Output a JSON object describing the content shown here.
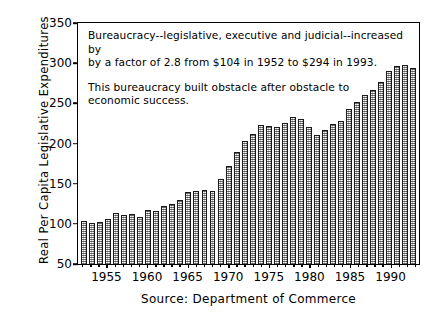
{
  "figure": {
    "ylabel": "Real Per Capita Legislative Expenditures",
    "source_note": "Source: Department of Commerce",
    "annotation_line_1": "Bureaucracy--legislative, executive and judicial--increased by",
    "annotation_line_2": "by a factor of 2.8 from $104 in 1952 to $294 in 1993.",
    "annotation_line_3": "This bureaucracy built obstacle after obstacle to",
    "annotation_line_4": "economic success.",
    "colors": {
      "bar_fill": "#c9c9c9",
      "bar_edge": "#1a1a1a",
      "axis": "#000000",
      "background": "#ffffff"
    }
  },
  "chart_data": {
    "type": "bar",
    "title": "",
    "xlabel": "",
    "ylabel": "Real Per Capita Legislative Expenditures",
    "ylim": [
      50,
      350
    ],
    "yticks": [
      50,
      100,
      150,
      200,
      250,
      300,
      350
    ],
    "xticks_labeled": [
      1955,
      1960,
      1965,
      1970,
      1975,
      1980,
      1985,
      1990
    ],
    "grid": false,
    "legend": "none",
    "annotations": [
      "Bureaucracy--legislative, executive and judicial--increased by by a factor of 2.8 from $104 in 1952 to $294 in 1993.",
      "This bureaucracy built obstacle after obstacle to economic success."
    ],
    "source": "Source: Department of Commerce",
    "categories": [
      1952,
      1953,
      1954,
      1955,
      1956,
      1957,
      1958,
      1959,
      1960,
      1961,
      1962,
      1963,
      1964,
      1965,
      1966,
      1967,
      1968,
      1969,
      1970,
      1971,
      1972,
      1973,
      1974,
      1975,
      1976,
      1977,
      1978,
      1979,
      1980,
      1981,
      1982,
      1983,
      1984,
      1985,
      1986,
      1987,
      1988,
      1989,
      1990,
      1991,
      1992,
      1993
    ],
    "values": [
      104,
      101,
      102,
      106,
      114,
      111,
      112,
      109,
      117,
      116,
      122,
      125,
      130,
      140,
      141,
      142,
      141,
      156,
      172,
      190,
      203,
      212,
      223,
      222,
      221,
      226,
      233,
      230,
      221,
      211,
      217,
      224,
      228,
      243,
      252,
      260,
      267,
      277,
      290,
      297,
      298,
      294
    ]
  }
}
